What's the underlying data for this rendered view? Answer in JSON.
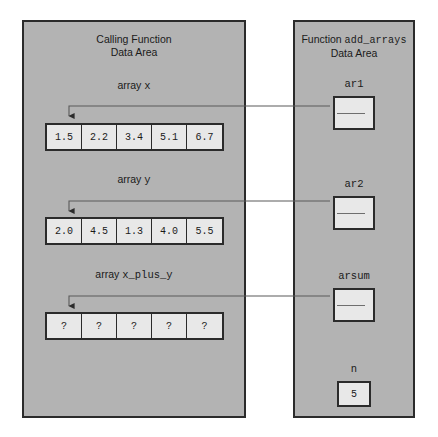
{
  "diagram": {
    "background_color": "#ffffff",
    "panel_color": "#b3b3b3",
    "box_color": "#e8e8e8",
    "border_color": "#2b2b2b",
    "connector_color": "#5a5a5a"
  },
  "left_panel": {
    "title_line1": "Calling Function",
    "title_line2": "Data Area",
    "arrays": [
      {
        "label_prefix": "array",
        "label_name": "x",
        "values": [
          "1.5",
          "2.2",
          "3.4",
          "5.1",
          "6.7"
        ]
      },
      {
        "label_prefix": "array",
        "label_name": "y",
        "values": [
          "2.0",
          "4.5",
          "1.3",
          "4.0",
          "5.5"
        ]
      },
      {
        "label_prefix": "array",
        "label_name": "x_plus_y",
        "values": [
          "?",
          "?",
          "?",
          "?",
          "?"
        ]
      }
    ]
  },
  "right_panel": {
    "title_prefix": "Function",
    "title_name": "add_arrays",
    "title_line2": "Data Area",
    "pointers": [
      {
        "label": "ar1",
        "points_to": "x"
      },
      {
        "label": "ar2",
        "points_to": "y"
      },
      {
        "label": "arsum",
        "points_to": "x_plus_y"
      }
    ],
    "scalar": {
      "label": "n",
      "value": "5"
    }
  }
}
